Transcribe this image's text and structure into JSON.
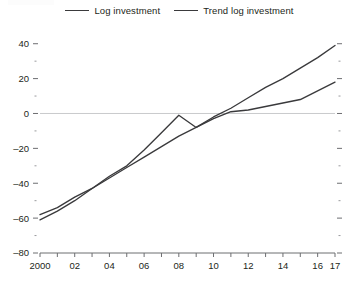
{
  "legend": {
    "position": "top-center",
    "entries": [
      {
        "label": "Log investment",
        "color": "#3a3a3c"
      },
      {
        "label": "Trend log investment",
        "color": "#3a3a3c"
      }
    ]
  },
  "axes": {
    "y_tick_labels": [
      "40",
      "20",
      "0",
      "–20",
      "–40",
      "–60",
      "–80"
    ],
    "x_tick_labels": [
      "2000",
      "02",
      "04",
      "06",
      "08",
      "10",
      "12",
      "14",
      "16",
      "17"
    ]
  },
  "chart_data": {
    "type": "line",
    "title": "",
    "xlabel": "",
    "ylabel": "",
    "xlim": [
      2000,
      2017
    ],
    "ylim": [
      -80,
      45
    ],
    "yticks": [
      -80,
      -60,
      -40,
      -20,
      0,
      20,
      40
    ],
    "yticks_minor": [
      -70,
      -50,
      -30,
      -10,
      10,
      30
    ],
    "xticks": [
      2000,
      2001,
      2002,
      2003,
      2004,
      2005,
      2006,
      2007,
      2008,
      2009,
      2010,
      2011,
      2012,
      2013,
      2014,
      2015,
      2016,
      2017
    ],
    "xticks_labeled": [
      2000,
      2002,
      2004,
      2006,
      2008,
      2010,
      2012,
      2014,
      2016,
      2017
    ],
    "grid": false,
    "zero_line": true,
    "x": [
      2000,
      2001,
      2002,
      2003,
      2004,
      2005,
      2006,
      2007,
      2008,
      2009,
      2010,
      2011,
      2012,
      2013,
      2014,
      2015,
      2016,
      2017
    ],
    "series": [
      {
        "name": "Log investment",
        "color": "#3a3a3c",
        "values": [
          -61,
          -56,
          -50,
          -43,
          -36,
          -30,
          -21,
          -11,
          -1,
          -8,
          -3,
          1,
          2,
          4,
          6,
          8,
          13,
          18
        ]
      },
      {
        "name": "Trend log investment",
        "color": "#3a3a3c",
        "values": [
          -58,
          -54,
          -48,
          -43,
          -37,
          -31,
          -25,
          -19,
          -13,
          -8,
          -2,
          3,
          9,
          15,
          20,
          26,
          32,
          39
        ]
      }
    ]
  }
}
